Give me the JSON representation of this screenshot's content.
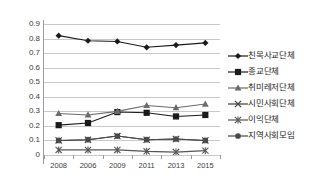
{
  "chart_data": {
    "type": "line",
    "title": "",
    "xlabel": "",
    "ylabel": "",
    "categories": [
      "2008",
      "2006",
      "2009",
      "2011",
      "2013",
      "2015"
    ],
    "ylim": [
      0,
      0.9
    ],
    "ytick_labels": [
      "0",
      "0.1",
      "0.2",
      "0.3",
      "0.4",
      "0.5",
      "0.6",
      "0.7",
      "0.8",
      "0.9"
    ],
    "ytick_values": [
      0,
      0.1,
      0.2,
      0.3,
      0.4,
      0.5,
      0.6,
      0.7,
      0.8,
      0.9
    ],
    "grid": true,
    "legend_position": "right",
    "series": [
      {
        "name": "친목사교단체",
        "marker": "diamond",
        "color": "#1a1a1a",
        "values": [
          0.82,
          0.785,
          0.78,
          0.74,
          0.755,
          0.77
        ]
      },
      {
        "name": "종교단체",
        "marker": "square",
        "color": "#1a1a1a",
        "values": [
          0.205,
          0.22,
          0.295,
          0.29,
          0.265,
          0.275
        ]
      },
      {
        "name": "취미레저단체",
        "marker": "triangle",
        "color": "#6b6b6b",
        "values": [
          0.285,
          0.275,
          0.3,
          0.34,
          0.325,
          0.35
        ]
      },
      {
        "name": "시민사회단체",
        "marker": "x-cross",
        "color": "#3d3d3d",
        "values": [
          0.1,
          0.105,
          0.13,
          0.105,
          0.11,
          0.1
        ]
      },
      {
        "name": "이익단체",
        "marker": "asterisk",
        "color": "#555555",
        "values": [
          0.035,
          0.035,
          0.035,
          0.025,
          0.02,
          0.03
        ]
      },
      {
        "name": "지역사회모임",
        "marker": "circle",
        "color": "#4a4a4a",
        "values": [
          0.1,
          0.105,
          0.13,
          0.105,
          0.11,
          0.1
        ]
      }
    ]
  }
}
